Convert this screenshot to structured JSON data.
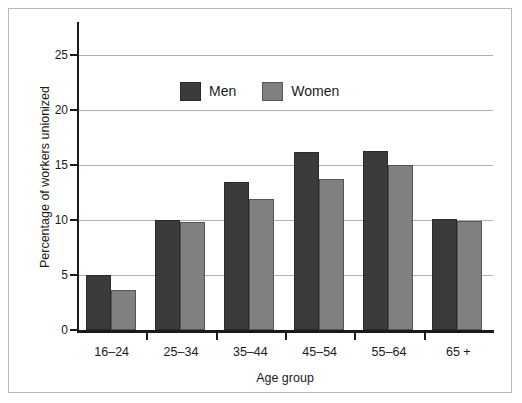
{
  "chart_data": {
    "type": "bar",
    "title": "",
    "xlabel": "Age group",
    "ylabel": "Percentage of workers unionized",
    "categories": [
      "16–24",
      "25–34",
      "35–44",
      "45–54",
      "55–64",
      "65 +"
    ],
    "series": [
      {
        "name": "Men",
        "color": "#3b3b3b",
        "values": [
          5.0,
          10.0,
          13.5,
          16.2,
          16.3,
          10.1
        ]
      },
      {
        "name": "Women",
        "color": "#808080",
        "values": [
          3.6,
          9.8,
          11.9,
          13.7,
          15.0,
          9.9
        ]
      }
    ],
    "ylim": [
      0,
      28
    ],
    "yticks": [
      0,
      5,
      10,
      15,
      20,
      25
    ],
    "ytick_labels": [
      "0",
      "5",
      "10",
      "15",
      "20",
      "25"
    ],
    "grid": true,
    "legend_position": "upper-left-inside"
  },
  "legend": {
    "men_label": "Men",
    "women_label": "Women"
  },
  "axes": {
    "x_title": "Age group",
    "y_title": "Percentage of workers unionized"
  }
}
